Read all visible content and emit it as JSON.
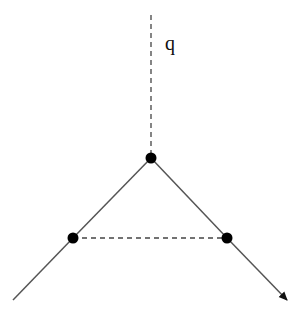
{
  "diagram": {
    "type": "feynman-like vertex diagram",
    "labels": {
      "momentum": "q"
    },
    "colors": {
      "line": "#444444",
      "vertex": "#000000",
      "background": "#ffffff"
    },
    "vertices": [
      {
        "id": "top",
        "x": 151,
        "y": 158
      },
      {
        "id": "left",
        "x": 73,
        "y": 238
      },
      {
        "id": "right",
        "x": 227,
        "y": 238
      }
    ],
    "edges": [
      {
        "id": "incoming-q",
        "style": "dashed",
        "from": [
          151,
          15
        ],
        "to": [
          151,
          158
        ]
      },
      {
        "id": "top-left",
        "style": "solid",
        "from": [
          151,
          158
        ],
        "to": [
          73,
          238
        ]
      },
      {
        "id": "left-out",
        "style": "solid",
        "from": [
          73,
          238
        ],
        "to": [
          13,
          300
        ]
      },
      {
        "id": "top-right",
        "style": "solid",
        "from": [
          151,
          158
        ],
        "to": [
          227,
          238
        ]
      },
      {
        "id": "right-out",
        "style": "solid-arrow",
        "from": [
          227,
          238
        ],
        "to": [
          287,
          300
        ]
      },
      {
        "id": "left-right",
        "style": "dashed",
        "from": [
          73,
          238
        ],
        "to": [
          227,
          238
        ]
      }
    ]
  }
}
